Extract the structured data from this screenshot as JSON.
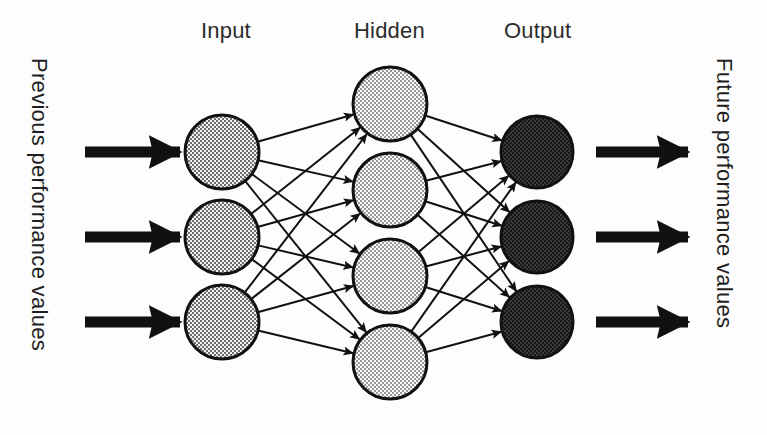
{
  "diagram": {
    "type": "neural-network",
    "canvas": {
      "width": 767,
      "height": 435,
      "background": "#fdfdfd"
    },
    "labels": {
      "input": "Input",
      "hidden": "Hidden",
      "output": "Output",
      "left_axis": "Previous performance values",
      "right_axis": "Future performance values"
    },
    "colors": {
      "stroke": "#111111",
      "input_fill": "#9a9a9a",
      "hidden_fill": "#bdbdbd",
      "output_fill": "#4a4a4a",
      "arrow": "#111111",
      "text": "#1f1f1f",
      "background": "#fdfdfd"
    },
    "label_positions": {
      "input_x": 226,
      "hidden_x": 389,
      "output_x": 537,
      "label_y": 18
    },
    "geometry": {
      "node_radius": 37,
      "output_node_radius": 36,
      "input_layer_x": 222,
      "hidden_layer_x": 390,
      "output_layer_x": 537,
      "thick_arrow_stroke": 11,
      "connection_stroke": 2
    },
    "layers": [
      {
        "name": "input",
        "label": "Input",
        "node_count": 3,
        "x": 222,
        "fill": "#9a9a9a",
        "nodes": [
          {
            "id": "i1",
            "cy": 152
          },
          {
            "id": "i2",
            "cy": 237
          },
          {
            "id": "i3",
            "cy": 322
          }
        ]
      },
      {
        "name": "hidden",
        "label": "Hidden",
        "node_count": 4,
        "x": 390,
        "fill": "#bdbdbd",
        "nodes": [
          {
            "id": "h1",
            "cy": 104
          },
          {
            "id": "h2",
            "cy": 190
          },
          {
            "id": "h3",
            "cy": 276
          },
          {
            "id": "h4",
            "cy": 362
          }
        ]
      },
      {
        "name": "output",
        "label": "Output",
        "node_count": 3,
        "x": 537,
        "fill": "#4a4a4a",
        "nodes": [
          {
            "id": "o1",
            "cy": 152
          },
          {
            "id": "o2",
            "cy": 237
          },
          {
            "id": "o3",
            "cy": 322
          }
        ]
      }
    ],
    "input_arrows": [
      {
        "id": "in-arrow-1",
        "x1": 85,
        "x2": 180,
        "y": 152
      },
      {
        "id": "in-arrow-2",
        "x1": 85,
        "x2": 180,
        "y": 237
      },
      {
        "id": "in-arrow-3",
        "x1": 85,
        "x2": 180,
        "y": 322
      }
    ],
    "output_arrows": [
      {
        "id": "out-arrow-1",
        "x1": 596,
        "x2": 688,
        "y": 152
      },
      {
        "id": "out-arrow-2",
        "x1": 596,
        "x2": 688,
        "y": 237
      },
      {
        "id": "out-arrow-3",
        "x1": 596,
        "x2": 688,
        "y": 322
      }
    ],
    "connections": {
      "fully_connected": true,
      "input_to_hidden_count": 12,
      "hidden_to_output_count": 12
    }
  }
}
